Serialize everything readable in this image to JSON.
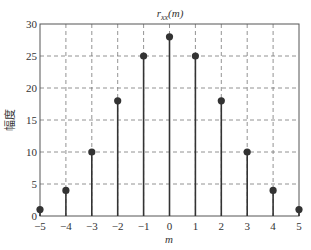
{
  "chart_data": {
    "type": "stem",
    "title_main": "r",
    "title_sub": "xx",
    "title_arg": "(m)",
    "xlabel": "m",
    "ylabel": "幅度",
    "x": [
      -5,
      -4,
      -3,
      -2,
      -1,
      0,
      1,
      2,
      3,
      4,
      5
    ],
    "values": [
      1,
      4,
      10,
      18,
      25,
      28,
      25,
      18,
      10,
      4,
      1
    ],
    "xlim": [
      -5,
      5
    ],
    "ylim": [
      0,
      30
    ],
    "xticks": [
      "−5",
      "−4",
      "−3",
      "−2",
      "−1",
      "0",
      "1",
      "2",
      "3",
      "4",
      "5"
    ],
    "yticks": [
      "0",
      "5",
      "10",
      "15",
      "20",
      "25",
      "30"
    ],
    "grid": true,
    "colors": {
      "stem": "#333333",
      "grid": "#777777",
      "axis": "#555555"
    }
  }
}
